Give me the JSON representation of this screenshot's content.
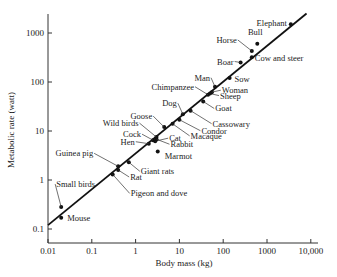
{
  "chart_data": {
    "type": "scatter",
    "title": "",
    "xlabel": "Body mass (kg)",
    "ylabel": "Metabolic rate (watt)",
    "xscale": "log",
    "yscale": "log",
    "xlim": [
      0.01,
      10000
    ],
    "ylim": [
      0.1,
      3000
    ],
    "x_ticks": [
      "0.01",
      "0.1",
      "1",
      "10",
      "100",
      "1000",
      "10,000"
    ],
    "y_ticks": [
      "0.1",
      "1",
      "10",
      "100",
      "1000"
    ],
    "grid": false,
    "legend": null,
    "fit_line": {
      "x": [
        0.01,
        8000
      ],
      "y": [
        0.12,
        2500
      ]
    },
    "points": [
      {
        "label": "Mouse",
        "x": 0.02,
        "y": 0.17
      },
      {
        "label": "Small birds",
        "x": 0.02,
        "y": 0.28
      },
      {
        "label": "Rat",
        "x": 0.4,
        "y": 1.6
      },
      {
        "label": "Pigeon and dove",
        "x": 0.3,
        "y": 1.3
      },
      {
        "label": "Guinea pig",
        "x": 0.4,
        "y": 1.9
      },
      {
        "label": "Giant rats",
        "x": 0.7,
        "y": 2.3
      },
      {
        "label": "Hen",
        "x": 2.0,
        "y": 5.5
      },
      {
        "label": "Cock",
        "x": 2.5,
        "y": 6.5
      },
      {
        "label": "Cat",
        "x": 2.8,
        "y": 6.2
      },
      {
        "label": "Wild birds",
        "x": 3.0,
        "y": 7.5
      },
      {
        "label": "Rabbit",
        "x": 3.0,
        "y": 6.8
      },
      {
        "label": "Marmot",
        "x": 3.2,
        "y": 3.8
      },
      {
        "label": "Goose",
        "x": 4.5,
        "y": 12
      },
      {
        "label": "Macaque",
        "x": 7,
        "y": 14
      },
      {
        "label": "Condor",
        "x": 10,
        "y": 17
      },
      {
        "label": "Dog",
        "x": 12,
        "y": 22
      },
      {
        "label": "Cassowary",
        "x": 18,
        "y": 26
      },
      {
        "label": "Goat",
        "x": 35,
        "y": 40
      },
      {
        "label": "Chimpanzee",
        "x": 45,
        "y": 55
      },
      {
        "label": "Sheep",
        "x": 50,
        "y": 58
      },
      {
        "label": "Woman",
        "x": 55,
        "y": 62
      },
      {
        "label": "Man",
        "x": 65,
        "y": 80
      },
      {
        "label": "Sow",
        "x": 140,
        "y": 120
      },
      {
        "label": "Boar",
        "x": 250,
        "y": 250
      },
      {
        "label": "Cow and steer",
        "x": 450,
        "y": 320
      },
      {
        "label": "Horse",
        "x": 450,
        "y": 430
      },
      {
        "label": "Bull",
        "x": 600,
        "y": 600
      },
      {
        "label": "Elephant",
        "x": 3500,
        "y": 1500
      }
    ]
  }
}
